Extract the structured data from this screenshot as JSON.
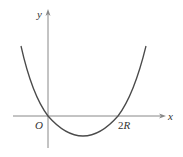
{
  "diagram": {
    "type": "function-graph",
    "axes": {
      "x_label": "x",
      "y_label": "y",
      "origin_label": "O"
    },
    "annotations": {
      "root_right_number": "2",
      "root_right_symbol": "R"
    },
    "curve": {
      "shape": "upward-opening parabola",
      "roots": [
        "O",
        "2R"
      ],
      "color": "#4a4a4a"
    },
    "colors": {
      "axis": "#888888",
      "curve": "#4a4a4a",
      "text": "#333333",
      "background": "#ffffff"
    }
  }
}
